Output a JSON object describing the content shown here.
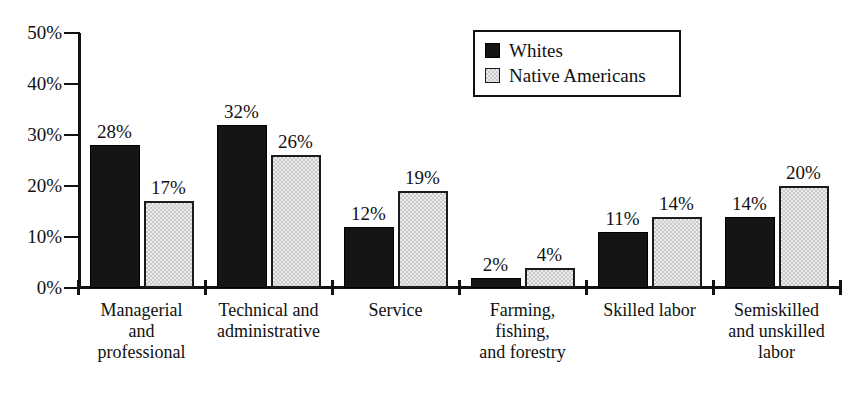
{
  "chart_data": {
    "type": "bar",
    "title": "",
    "xlabel": "",
    "ylabel": "",
    "ylim": [
      0,
      50
    ],
    "grid": false,
    "legend_position": "top-right",
    "ytick_labels": [
      "0%",
      "10%",
      "20%",
      "30%",
      "40%",
      "50%"
    ],
    "ytick_values": [
      0,
      10,
      20,
      30,
      40,
      50
    ],
    "categories": [
      "Managerial and professional",
      "Technical and administrative",
      "Service",
      "Farming, fishing, and forestry",
      "Skilled labor",
      "Semiskilled and unskilled labor"
    ],
    "category_label_lines": [
      [
        "Managerial",
        "and",
        "professional"
      ],
      [
        "Technical and",
        "administrative"
      ],
      [
        "Service"
      ],
      [
        "Farming,",
        "fishing,",
        "and forestry"
      ],
      [
        "Skilled labor"
      ],
      [
        "Semiskilled",
        "and unskilled",
        "labor"
      ]
    ],
    "series": [
      {
        "name": "Whites",
        "color": "#151515",
        "values": [
          28,
          32,
          12,
          2,
          11,
          14
        ],
        "value_labels": [
          "28%",
          "32%",
          "12%",
          "2%",
          "11%",
          "14%"
        ]
      },
      {
        "name": "Native Americans",
        "color": "#c9c9c9",
        "values": [
          17,
          26,
          19,
          4,
          14,
          20
        ],
        "value_labels": [
          "17%",
          "26%",
          "19%",
          "4%",
          "14%",
          "20%"
        ]
      }
    ]
  },
  "legend": {
    "items": [
      {
        "label": "Whites",
        "swatch": "whites"
      },
      {
        "label": "Native Americans",
        "swatch": "natives"
      }
    ]
  }
}
